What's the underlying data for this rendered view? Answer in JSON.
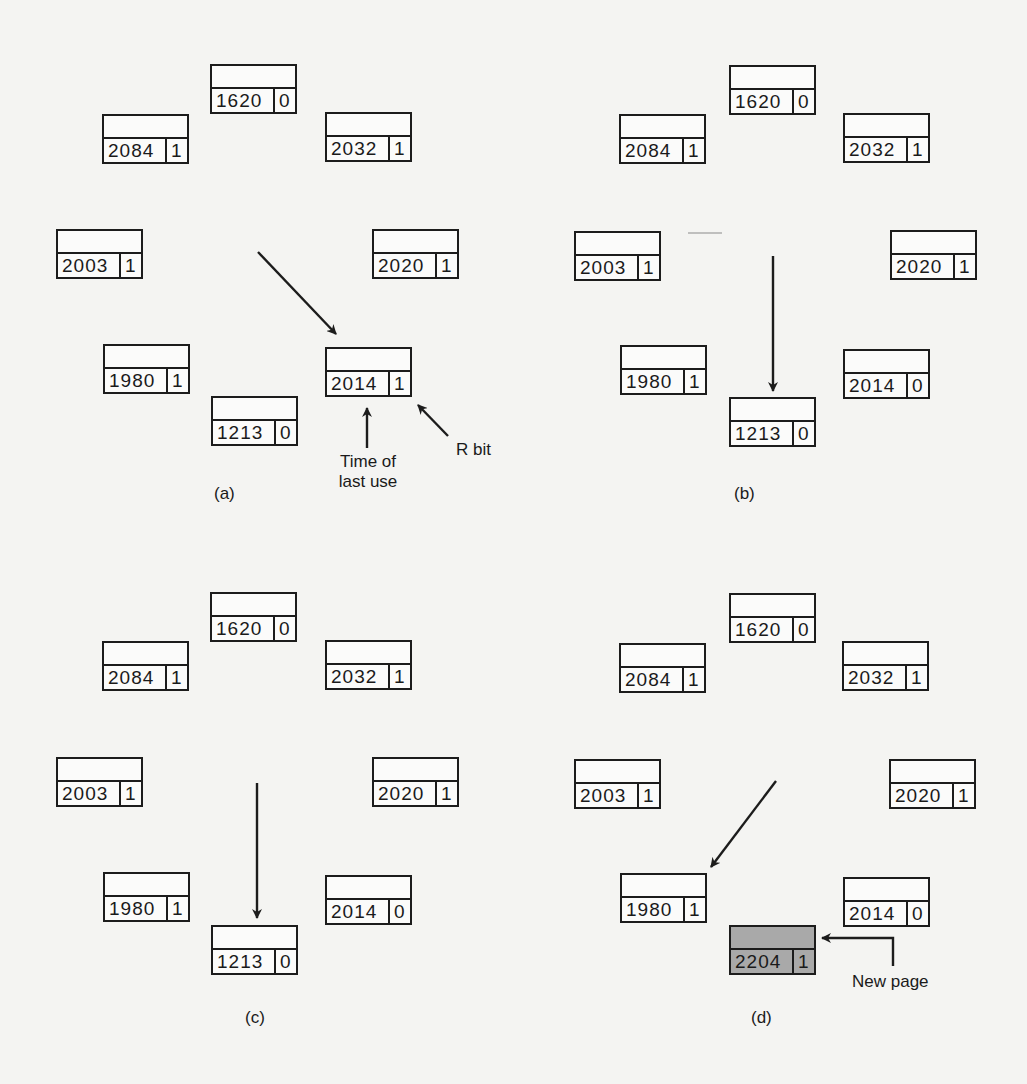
{
  "figure": {
    "panels": [
      {
        "id": "a",
        "caption": "(a)",
        "pages": [
          {
            "time": "1620",
            "r": "0",
            "x": 210,
            "y": 64
          },
          {
            "time": "2084",
            "r": "1",
            "x": 102,
            "y": 114
          },
          {
            "time": "2032",
            "r": "1",
            "x": 325,
            "y": 112
          },
          {
            "time": "2003",
            "r": "1",
            "x": 56,
            "y": 229
          },
          {
            "time": "2020",
            "r": "1",
            "x": 372,
            "y": 229
          },
          {
            "time": "1980",
            "r": "1",
            "x": 103,
            "y": 344
          },
          {
            "time": "2014",
            "r": "1",
            "x": 325,
            "y": 347
          },
          {
            "time": "1213",
            "r": "0",
            "x": 211,
            "y": 396
          }
        ],
        "annotations": {
          "time_label_line1": "Time of",
          "time_label_line2": "last use",
          "rbit_label": "R bit"
        }
      },
      {
        "id": "b",
        "caption": "(b)",
        "pages": [
          {
            "time": "1620",
            "r": "0",
            "x": 729,
            "y": 65
          },
          {
            "time": "2084",
            "r": "1",
            "x": 619,
            "y": 114
          },
          {
            "time": "2032",
            "r": "1",
            "x": 843,
            "y": 113
          },
          {
            "time": "2003",
            "r": "1",
            "x": 574,
            "y": 231
          },
          {
            "time": "2020",
            "r": "1",
            "x": 890,
            "y": 230
          },
          {
            "time": "1980",
            "r": "1",
            "x": 620,
            "y": 345
          },
          {
            "time": "2014",
            "r": "0",
            "x": 843,
            "y": 349
          },
          {
            "time": "1213",
            "r": "0",
            "x": 729,
            "y": 397
          }
        ]
      },
      {
        "id": "c",
        "caption": "(c)",
        "pages": [
          {
            "time": "1620",
            "r": "0",
            "x": 210,
            "y": 592
          },
          {
            "time": "2084",
            "r": "1",
            "x": 102,
            "y": 641
          },
          {
            "time": "2032",
            "r": "1",
            "x": 325,
            "y": 640
          },
          {
            "time": "2003",
            "r": "1",
            "x": 56,
            "y": 757
          },
          {
            "time": "2020",
            "r": "1",
            "x": 372,
            "y": 757
          },
          {
            "time": "1980",
            "r": "1",
            "x": 103,
            "y": 872
          },
          {
            "time": "2014",
            "r": "0",
            "x": 325,
            "y": 875
          },
          {
            "time": "1213",
            "r": "0",
            "x": 211,
            "y": 925
          }
        ]
      },
      {
        "id": "d",
        "caption": "(d)",
        "pages": [
          {
            "time": "1620",
            "r": "0",
            "x": 729,
            "y": 593
          },
          {
            "time": "2084",
            "r": "1",
            "x": 619,
            "y": 643
          },
          {
            "time": "2032",
            "r": "1",
            "x": 842,
            "y": 641
          },
          {
            "time": "2003",
            "r": "1",
            "x": 574,
            "y": 759
          },
          {
            "time": "2020",
            "r": "1",
            "x": 889,
            "y": 759
          },
          {
            "time": "1980",
            "r": "1",
            "x": 620,
            "y": 873
          },
          {
            "time": "2014",
            "r": "0",
            "x": 843,
            "y": 877
          },
          {
            "time": "2204",
            "r": "1",
            "x": 729,
            "y": 925,
            "highlight": true
          }
        ],
        "annotations": {
          "new_page_label": "New page"
        }
      }
    ]
  },
  "colors": {
    "background": "#f4f4f2",
    "stroke": "#1c1c1c",
    "new_page_fill": "#a9a9a9"
  }
}
